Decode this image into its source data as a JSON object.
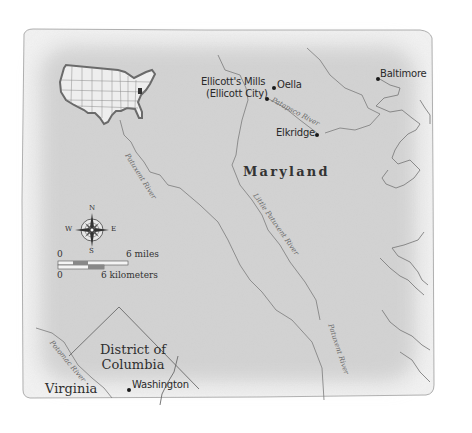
{
  "map": {
    "paper_color": "#d9d9d9",
    "paper_edge_color": "#f2f2f2",
    "line_color": "#777777",
    "text_color": "#2a2a2a",
    "state_label": "Maryland",
    "regions": {
      "dc": {
        "line1": "District of",
        "line2": "Columbia"
      },
      "virginia": "Virginia"
    },
    "cities": [
      {
        "name": "Baltimore",
        "x": 378,
        "y": 77
      },
      {
        "name": "Oella",
        "x": 274,
        "y": 88
      },
      {
        "name": "Ellicott's Mills",
        "x": 267,
        "y": 97
      },
      {
        "name": "(Ellicott City)",
        "x": 267,
        "y": 97
      },
      {
        "name": "Elkridge",
        "x": 317,
        "y": 133
      },
      {
        "name": "Washington",
        "x": 129,
        "y": 389
      }
    ],
    "city_labels": {
      "baltimore": "Baltimore",
      "oella": "Oella",
      "ellicotts_mills_line1": "Ellicott's Mills",
      "ellicotts_mills_line2": "(Ellicott City)",
      "elkridge": "Elkridge",
      "washington": "Washington"
    },
    "rivers": {
      "patapsco": "Patapsco River",
      "patuxent_upper": "Patuxent River",
      "little_patuxent": "Little Patuxent River",
      "patuxent_lower": "Patuxent River",
      "potomac": "Potomac River"
    },
    "compass": {
      "north": "N",
      "south": "S",
      "east": "E",
      "west": "W"
    },
    "scale": {
      "miles_start": "0",
      "miles_end": "6 miles",
      "km_start": "0",
      "km_end": "6 kilometers"
    },
    "inset": {
      "description": "United States locator map with Maryland highlighted"
    }
  }
}
